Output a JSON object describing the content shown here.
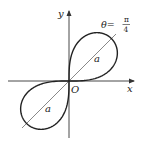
{
  "figure": {
    "type": "polar-curve",
    "curve": "lemniscate r^2 = a^2 sin 2θ",
    "axes": {
      "x_label": "x",
      "y_label": "y",
      "origin_label": "O"
    },
    "annotation": {
      "theta_label": "θ=",
      "theta_num": "π",
      "theta_den": "4"
    },
    "radius_labels": [
      "a",
      "a"
    ],
    "colors": {
      "curve": "#222222",
      "axis": "#333333",
      "guide_line": "#555555",
      "background": "#ffffff"
    }
  }
}
